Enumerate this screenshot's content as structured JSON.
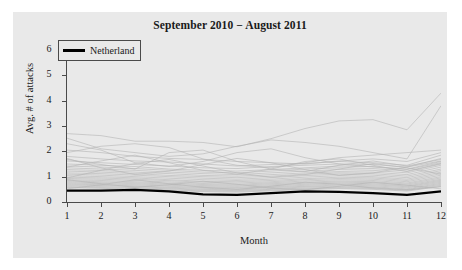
{
  "figure": {
    "title": "September 2010 − August 2011",
    "background_color": "#e9e9e9",
    "highlight_color": "#000000",
    "series_color": "#b4b4b4"
  },
  "legend": {
    "entries": [
      {
        "label": "Netherland",
        "marker": "solid-line",
        "color": "#000000"
      }
    ]
  },
  "axes": {
    "x": {
      "title": "Month",
      "ticks": [
        "1",
        "2",
        "3",
        "4",
        "5",
        "6",
        "7",
        "8",
        "9",
        "10",
        "11",
        "12"
      ]
    },
    "y": {
      "title": "Avg. # of attacks",
      "ticks": [
        "0",
        "1",
        "2",
        "3",
        "4",
        "5",
        "6"
      ]
    }
  },
  "chart_data": {
    "type": "line",
    "title": "September 2010 − August 2011",
    "xlabel": "Month",
    "ylabel": "Avg. # of attacks",
    "xlim": [
      1,
      12
    ],
    "ylim": [
      0,
      6
    ],
    "xticks": [
      1,
      2,
      3,
      4,
      5,
      6,
      7,
      8,
      9,
      10,
      11,
      12
    ],
    "yticks": [
      0,
      1,
      2,
      3,
      4,
      5,
      6
    ],
    "grid": false,
    "legend_position": "top-left",
    "x": [
      1,
      2,
      3,
      4,
      5,
      6,
      7,
      8,
      9,
      10,
      11,
      12
    ],
    "highlight_series": {
      "name": "Netherland",
      "color": "#000000",
      "linewidth": 2.2,
      "values": [
        0.45,
        0.45,
        0.48,
        0.42,
        0.3,
        0.28,
        0.35,
        0.42,
        0.4,
        0.35,
        0.28,
        0.42
      ]
    },
    "series": [
      {
        "name": "country-01",
        "color": "#b4b4b4",
        "values": [
          2.7,
          2.62,
          2.4,
          2.4,
          2.35,
          2.18,
          2.5,
          2.9,
          3.2,
          3.25,
          2.85,
          4.3
        ]
      },
      {
        "name": "country-02",
        "color": "#b4b4b4",
        "values": [
          2.52,
          2.1,
          1.95,
          1.8,
          1.9,
          2.2,
          2.45,
          2.35,
          2.2,
          1.95,
          1.7,
          3.8
        ]
      },
      {
        "name": "country-03",
        "color": "#b4b4b4",
        "values": [
          1.95,
          2.2,
          2.3,
          2.15,
          1.7,
          1.45,
          1.35,
          1.55,
          1.75,
          1.85,
          1.95,
          2.05
        ]
      },
      {
        "name": "country-04",
        "color": "#b4b4b4",
        "values": [
          2.05,
          1.95,
          1.8,
          1.72,
          1.68,
          1.6,
          1.55,
          1.5,
          1.62,
          1.7,
          1.6,
          1.95
        ]
      },
      {
        "name": "country-05",
        "color": "#b4b4b4",
        "values": [
          1.8,
          1.7,
          1.62,
          1.58,
          1.5,
          1.42,
          1.48,
          1.52,
          1.6,
          1.55,
          1.45,
          1.85
        ]
      },
      {
        "name": "country-06",
        "color": "#b4b4b4",
        "values": [
          1.62,
          1.55,
          1.48,
          1.42,
          1.35,
          1.32,
          1.4,
          1.45,
          1.5,
          1.48,
          1.38,
          1.72
        ]
      },
      {
        "name": "country-07",
        "color": "#b4b4b4",
        "values": [
          1.5,
          1.45,
          1.4,
          1.3,
          1.25,
          1.22,
          1.28,
          1.35,
          1.42,
          1.4,
          1.3,
          1.6
        ]
      },
      {
        "name": "country-08",
        "color": "#b4b4b4",
        "values": [
          1.42,
          1.38,
          1.32,
          1.25,
          1.18,
          1.15,
          1.22,
          1.3,
          1.35,
          1.32,
          1.22,
          1.52
        ]
      },
      {
        "name": "country-09",
        "color": "#b4b4b4",
        "values": [
          1.35,
          1.3,
          1.25,
          1.18,
          1.12,
          1.08,
          1.15,
          1.22,
          1.28,
          1.25,
          1.15,
          1.45
        ]
      },
      {
        "name": "country-10",
        "color": "#b4b4b4",
        "values": [
          1.28,
          1.24,
          1.18,
          1.12,
          1.05,
          1.02,
          1.08,
          1.15,
          1.2,
          1.18,
          1.08,
          1.38
        ]
      },
      {
        "name": "country-11",
        "color": "#b4b4b4",
        "values": [
          1.22,
          1.18,
          1.12,
          1.05,
          1.0,
          0.96,
          1.02,
          1.1,
          1.15,
          1.12,
          1.02,
          1.3
        ]
      },
      {
        "name": "country-12",
        "color": "#b4b4b4",
        "values": [
          1.15,
          1.12,
          1.06,
          1.0,
          0.94,
          0.9,
          0.96,
          1.04,
          1.1,
          1.06,
          0.96,
          1.24
        ]
      },
      {
        "name": "country-13",
        "color": "#b4b4b4",
        "values": [
          1.1,
          1.06,
          1.0,
          0.94,
          0.88,
          0.85,
          0.9,
          0.98,
          1.04,
          1.0,
          0.9,
          1.18
        ]
      },
      {
        "name": "country-14",
        "color": "#b4b4b4",
        "values": [
          1.04,
          1.0,
          0.95,
          0.88,
          0.82,
          0.8,
          0.85,
          0.92,
          0.98,
          0.95,
          0.85,
          1.12
        ]
      },
      {
        "name": "country-15",
        "color": "#b4b4b4",
        "values": [
          0.98,
          0.95,
          0.9,
          0.84,
          0.78,
          0.75,
          0.8,
          0.88,
          0.93,
          0.9,
          0.8,
          1.06
        ]
      },
      {
        "name": "country-16",
        "color": "#b4b4b4",
        "values": [
          0.93,
          0.9,
          0.85,
          0.79,
          0.73,
          0.7,
          0.76,
          0.83,
          0.88,
          0.85,
          0.75,
          1.0
        ]
      },
      {
        "name": "country-17",
        "color": "#b4b4b4",
        "values": [
          0.88,
          0.85,
          0.8,
          0.74,
          0.69,
          0.66,
          0.72,
          0.78,
          0.83,
          0.8,
          0.71,
          0.95
        ]
      },
      {
        "name": "country-18",
        "color": "#b4b4b4",
        "values": [
          0.84,
          0.8,
          0.76,
          0.7,
          0.65,
          0.62,
          0.68,
          0.74,
          0.79,
          0.76,
          0.67,
          0.9
        ]
      },
      {
        "name": "country-19",
        "color": "#b4b4b4",
        "values": [
          0.8,
          0.76,
          0.72,
          0.66,
          0.61,
          0.58,
          0.64,
          0.7,
          0.75,
          0.72,
          0.63,
          0.86
        ]
      },
      {
        "name": "country-20",
        "color": "#b4b4b4",
        "values": [
          0.76,
          0.72,
          0.68,
          0.62,
          0.57,
          0.55,
          0.6,
          0.66,
          0.71,
          0.68,
          0.6,
          0.82
        ]
      },
      {
        "name": "country-21",
        "color": "#b4b4b4",
        "values": [
          0.72,
          0.68,
          0.64,
          0.58,
          0.54,
          0.51,
          0.57,
          0.62,
          0.67,
          0.64,
          0.56,
          0.78
        ]
      },
      {
        "name": "country-22",
        "color": "#b4b4b4",
        "values": [
          0.68,
          0.65,
          0.61,
          0.55,
          0.5,
          0.48,
          0.53,
          0.59,
          0.63,
          0.6,
          0.52,
          0.74
        ]
      },
      {
        "name": "country-23",
        "color": "#b4b4b4",
        "values": [
          0.64,
          0.61,
          0.57,
          0.52,
          0.47,
          0.45,
          0.5,
          0.55,
          0.59,
          0.57,
          0.49,
          0.7
        ]
      },
      {
        "name": "country-24",
        "color": "#b4b4b4",
        "values": [
          0.6,
          0.57,
          0.54,
          0.48,
          0.44,
          0.42,
          0.47,
          0.52,
          0.56,
          0.53,
          0.46,
          0.66
        ]
      },
      {
        "name": "country-25",
        "color": "#b4b4b4",
        "values": [
          0.57,
          0.54,
          0.5,
          0.45,
          0.41,
          0.39,
          0.44,
          0.49,
          0.53,
          0.5,
          0.43,
          0.62
        ]
      },
      {
        "name": "country-26",
        "color": "#b4b4b4",
        "values": [
          1.68,
          1.48,
          1.3,
          1.95,
          2.05,
          1.6,
          1.3,
          1.2,
          1.45,
          1.62,
          1.42,
          1.68
        ]
      },
      {
        "name": "country-27",
        "color": "#b4b4b4",
        "values": [
          2.3,
          2.05,
          1.55,
          1.4,
          1.6,
          1.95,
          2.1,
          1.75,
          1.5,
          1.38,
          1.28,
          1.55
        ]
      },
      {
        "name": "country-28",
        "color": "#b4b4b4",
        "values": [
          1.38,
          1.62,
          1.85,
          1.55,
          1.25,
          1.1,
          1.3,
          1.6,
          1.7,
          1.45,
          1.2,
          1.5
        ]
      },
      {
        "name": "country-29",
        "color": "#b4b4b4",
        "values": [
          0.95,
          1.25,
          1.52,
          1.68,
          1.42,
          1.15,
          0.98,
          1.08,
          1.3,
          1.52,
          1.35,
          1.1
        ]
      },
      {
        "name": "country-30",
        "color": "#b4b4b4",
        "values": [
          1.72,
          1.35,
          1.08,
          1.22,
          1.48,
          1.72,
          1.55,
          1.28,
          1.05,
          1.15,
          1.38,
          1.62
        ]
      },
      {
        "name": "country-31",
        "color": "#b4b4b4",
        "values": [
          0.52,
          0.68,
          0.88,
          0.72,
          0.58,
          0.5,
          0.62,
          0.78,
          0.7,
          0.55,
          0.48,
          0.6
        ]
      },
      {
        "name": "country-32",
        "color": "#b4b4b4",
        "values": [
          0.88,
          0.72,
          0.58,
          0.68,
          0.82,
          0.7,
          0.55,
          0.48,
          0.62,
          0.78,
          0.66,
          0.52
        ]
      }
    ]
  }
}
